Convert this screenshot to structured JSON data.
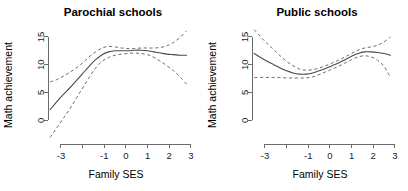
{
  "figure": {
    "background": "#ffffff",
    "line_color": "#4a4a4a",
    "ci_color": "#6e6e6e",
    "axis_color": "#6b6b6b",
    "panel_count": 2
  },
  "chart_data": [
    {
      "type": "line",
      "title": "Parochial schools",
      "xlabel": "Family SES",
      "ylabel": "Math achievement",
      "xlim": [
        -3.6,
        3.1
      ],
      "ylim": [
        -3.2,
        16.6
      ],
      "grid": false,
      "legend": "none",
      "xticks": [
        -3,
        -2,
        -1,
        0,
        1,
        2,
        3
      ],
      "xticklabels": [
        "-3",
        "",
        "-1",
        "0",
        "1",
        "2",
        "3"
      ],
      "yticks": [
        0,
        5,
        10,
        15
      ],
      "yticklabels": [
        "0",
        "5",
        "10",
        "15"
      ],
      "series": [
        {
          "name": "fit",
          "style": "solid",
          "x": [
            -3.5,
            -3.2,
            -2.9,
            -2.6,
            -2.3,
            -2.0,
            -1.7,
            -1.4,
            -1.1,
            -0.8,
            -0.5,
            -0.2,
            0.1,
            0.4,
            0.7,
            1.0,
            1.3,
            1.6,
            1.9,
            2.2,
            2.5,
            2.8
          ],
          "y": [
            1.9,
            3.3,
            4.6,
            5.8,
            7.1,
            8.4,
            9.7,
            10.9,
            11.8,
            12.3,
            12.5,
            12.5,
            12.5,
            12.6,
            12.6,
            12.5,
            12.3,
            12.1,
            11.9,
            11.8,
            11.7,
            11.7
          ]
        },
        {
          "name": "upper-ci",
          "style": "dashed",
          "x": [
            -3.5,
            -3.2,
            -2.9,
            -2.6,
            -2.3,
            -2.0,
            -1.7,
            -1.4,
            -1.1,
            -0.8,
            -0.5,
            -0.2,
            0.1,
            0.4,
            0.7,
            1.0,
            1.3,
            1.6,
            1.9,
            2.2,
            2.5,
            2.8
          ],
          "y": [
            6.9,
            7.3,
            7.9,
            8.6,
            9.4,
            10.3,
            11.4,
            12.3,
            13.0,
            13.3,
            13.2,
            13.0,
            12.9,
            12.9,
            13.0,
            13.0,
            13.0,
            13.1,
            13.4,
            14.0,
            14.9,
            16.1
          ]
        },
        {
          "name": "lower-ci",
          "style": "dashed",
          "x": [
            -3.5,
            -3.2,
            -2.9,
            -2.6,
            -2.3,
            -2.0,
            -1.7,
            -1.4,
            -1.1,
            -0.8,
            -0.5,
            -0.2,
            0.1,
            0.4,
            0.7,
            1.0,
            1.3,
            1.6,
            1.9,
            2.2,
            2.5,
            2.8
          ],
          "y": [
            -3.1,
            -1.4,
            0.3,
            2.0,
            3.9,
            5.8,
            7.7,
            9.4,
            10.6,
            11.3,
            11.7,
            11.9,
            12.0,
            12.1,
            12.0,
            11.8,
            11.3,
            10.6,
            9.8,
            8.9,
            7.8,
            6.5
          ]
        }
      ]
    },
    {
      "type": "line",
      "title": "Public schools",
      "xlabel": "Family SES",
      "ylabel": "Math achievement",
      "xlim": [
        -3.6,
        3.1
      ],
      "ylim": [
        -3.2,
        16.6
      ],
      "grid": false,
      "legend": "none",
      "xticks": [
        -3,
        -2,
        -1,
        0,
        1,
        2,
        3
      ],
      "xticklabels": [
        "-3",
        "",
        "-1",
        "0",
        "1",
        "2",
        "3"
      ],
      "yticks": [
        0,
        5,
        10,
        15
      ],
      "yticklabels": [
        "0",
        "5",
        "10",
        "15"
      ],
      "series": [
        {
          "name": "fit",
          "style": "solid",
          "x": [
            -3.5,
            -3.2,
            -2.9,
            -2.6,
            -2.3,
            -2.0,
            -1.7,
            -1.4,
            -1.1,
            -0.8,
            -0.5,
            -0.2,
            0.1,
            0.4,
            0.7,
            1.0,
            1.3,
            1.6,
            1.9,
            2.2,
            2.5,
            2.8
          ],
          "y": [
            12.0,
            11.3,
            10.6,
            10.0,
            9.4,
            8.9,
            8.5,
            8.3,
            8.3,
            8.5,
            8.9,
            9.3,
            9.8,
            10.3,
            10.9,
            11.5,
            12.0,
            12.3,
            12.3,
            12.2,
            12.0,
            11.7
          ]
        },
        {
          "name": "upper-ci",
          "style": "dashed",
          "x": [
            -3.5,
            -3.2,
            -2.9,
            -2.6,
            -2.3,
            -2.0,
            -1.7,
            -1.4,
            -1.1,
            -0.8,
            -0.5,
            -0.2,
            0.1,
            0.4,
            0.7,
            1.0,
            1.3,
            1.6,
            1.9,
            2.2,
            2.5,
            2.8
          ],
          "y": [
            16.3,
            15.0,
            13.8,
            12.7,
            11.6,
            10.6,
            9.8,
            9.2,
            9.0,
            9.1,
            9.4,
            9.8,
            10.3,
            10.8,
            11.4,
            12.0,
            12.6,
            13.0,
            13.2,
            13.5,
            14.1,
            15.0
          ]
        },
        {
          "name": "lower-ci",
          "style": "dashed",
          "x": [
            -3.5,
            -3.2,
            -2.9,
            -2.6,
            -2.3,
            -2.0,
            -1.7,
            -1.4,
            -1.1,
            -0.8,
            -0.5,
            -0.2,
            0.1,
            0.4,
            0.7,
            1.0,
            1.3,
            1.6,
            1.9,
            2.2,
            2.5,
            2.8
          ],
          "y": [
            7.7,
            7.7,
            7.7,
            7.7,
            7.7,
            7.6,
            7.6,
            7.6,
            7.6,
            7.8,
            8.2,
            8.7,
            9.2,
            9.7,
            10.3,
            10.9,
            11.4,
            11.6,
            11.4,
            10.8,
            9.7,
            7.7
          ]
        }
      ]
    }
  ]
}
